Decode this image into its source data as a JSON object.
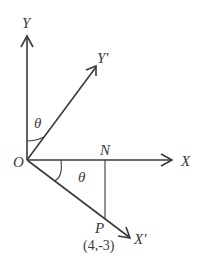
{
  "diagram": {
    "type": "coordinate-axes-rotation",
    "origin": {
      "label": "O"
    },
    "axes": [
      {
        "name": "y-axis",
        "label": "Y"
      },
      {
        "name": "y-prime-axis",
        "label": "Y′"
      },
      {
        "name": "x-axis",
        "label": "X"
      },
      {
        "name": "x-prime-axis",
        "label": "X′"
      }
    ],
    "points": {
      "N": {
        "label": "N"
      },
      "P": {
        "label": "P",
        "coords": "(4,-3)"
      }
    },
    "angles": [
      {
        "between": "Y and Y′",
        "label": "θ"
      },
      {
        "between": "X and X′",
        "label": "θ"
      }
    ],
    "colors": {
      "stroke": "#3a3a3a",
      "background": "#ffffff"
    }
  }
}
